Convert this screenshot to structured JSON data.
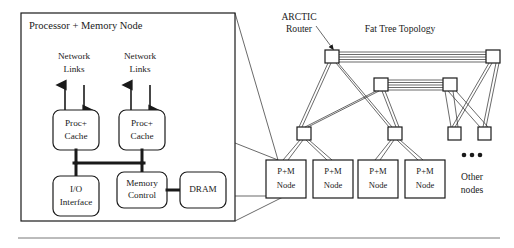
{
  "figure": {
    "panel": {
      "title": "Processor + Memory Node",
      "network_links_left": "Network\nLinks",
      "network_links_left_line1": "Network",
      "network_links_left_line2": "Links",
      "network_links_right_line1": "Network",
      "network_links_right_line2": "Links",
      "proc_cache_left_line1": "Proc+",
      "proc_cache_left_line2": "Cache",
      "proc_cache_right_line1": "Proc+",
      "proc_cache_right_line2": "Cache",
      "io_interface_line1": "I/O",
      "io_interface_line2": "Interface",
      "memory_control_line1": "Memory",
      "memory_control_line2": "Control",
      "dram": "DRAM"
    },
    "network": {
      "arctic_router_line1": "ARCTIC",
      "arctic_router_line2": "Router",
      "fat_tree_title": "Fat Tree Topology",
      "other_nodes_line1": "Other",
      "other_nodes_line2": "nodes",
      "ellipsis": "•••",
      "pm_nodes": [
        {
          "line1": "P+M",
          "line2": "Node"
        },
        {
          "line1": "P+M",
          "line2": "Node"
        },
        {
          "line1": "P+M",
          "line2": "Node"
        },
        {
          "line1": "P+M",
          "line2": "Node"
        }
      ]
    },
    "colors": {
      "ink": "#1a1a1a",
      "paper": "#ffffff",
      "rule": "#555555"
    }
  }
}
